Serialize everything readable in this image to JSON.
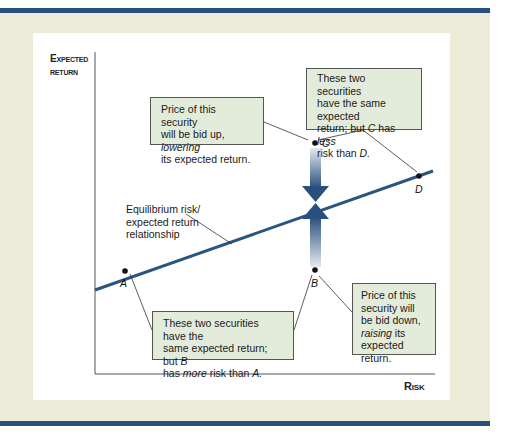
{
  "colors": {
    "frame_background": "#ecebd9",
    "frame_bars": "#27507e",
    "line": "#2a5580",
    "arrow_dark": "#27507e",
    "note_fill": "#e3ecda"
  },
  "axes": {
    "y_label_line1": "Expected",
    "y_label_line2": "return",
    "x_label": "Risk"
  },
  "line_label": {
    "line1": "Equilibrium risk/",
    "line2": "expected return",
    "line3": "relationship"
  },
  "points": {
    "A": "A",
    "B": "B",
    "C": "C",
    "D": "D"
  },
  "notes": {
    "c_note": {
      "t1": "Price of this security",
      "t2": "will be bid up, ",
      "t2_em": "lowering",
      "t3": "its expected return."
    },
    "cd_note": {
      "t1": "These two securities",
      "t2": "have the same expected",
      "t3a": "return; but ",
      "t3_em1": "C",
      "t3b": " has ",
      "t3_em2": "less",
      "t4a": "risk than ",
      "t4_em": "D."
    },
    "ab_note": {
      "t1": "These two securities have the",
      "t2a": "same expected return; but ",
      "t2_em": "B",
      "t3a": "has ",
      "t3_em": "more",
      "t3b": " risk than ",
      "t3_em2": "A."
    },
    "b_note": {
      "t1": "Price of this",
      "t2": "security will",
      "t3": "be bid down,",
      "t4_em": "raising",
      "t4b": " its",
      "t5": "expected return."
    }
  }
}
